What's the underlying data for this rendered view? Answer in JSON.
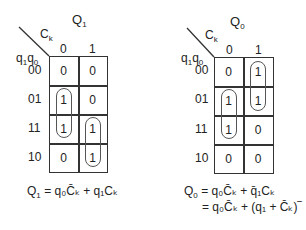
{
  "maps": [
    {
      "title": "Q",
      "title_sub": "1",
      "col_var": "C",
      "col_var_sub": "k",
      "row_var": "q",
      "row_var_sub1": "1",
      "row_var2": "q",
      "row_var_sub2": "0",
      "col_headers": [
        "0",
        "1"
      ],
      "row_headers": [
        "00",
        "01",
        "11",
        "10"
      ],
      "cells": [
        [
          "0",
          "0"
        ],
        [
          "1",
          "0"
        ],
        [
          "1",
          "1"
        ],
        [
          "0",
          "1"
        ]
      ],
      "groups": [
        {
          "col": 0,
          "rows": [
            1,
            2
          ]
        },
        {
          "col": 1,
          "rows": [
            2,
            3
          ]
        }
      ],
      "equation_lines": [
        {
          "lhs": "Q",
          "lhs_sub": "1",
          "rhs": "= q₀C̄ₖ + q₁Cₖ"
        }
      ]
    },
    {
      "title": "Q",
      "title_sub": "0",
      "col_var": "C",
      "col_var_sub": "k",
      "row_var": "q",
      "row_var_sub1": "1",
      "row_var2": "q",
      "row_var_sub2": "0",
      "col_headers": [
        "0",
        "1"
      ],
      "row_headers": [
        "00",
        "01",
        "11",
        "10"
      ],
      "cells": [
        [
          "0",
          "1"
        ],
        [
          "1",
          "1"
        ],
        [
          "1",
          "0"
        ],
        [
          "0",
          "0"
        ]
      ],
      "groups": [
        {
          "col": 1,
          "rows": [
            0,
            1
          ]
        },
        {
          "col": 0,
          "rows": [
            1,
            2
          ]
        }
      ],
      "equation_lines": [
        {
          "lhs": "Q",
          "lhs_sub": "0",
          "rhs": "= q₀C̄ₖ + q̄₁Cₖ"
        },
        {
          "lhs": "",
          "lhs_sub": "",
          "rhs": "= q₀C̄ₖ + (q₁ + C̄ₖ)‾"
        }
      ]
    }
  ]
}
